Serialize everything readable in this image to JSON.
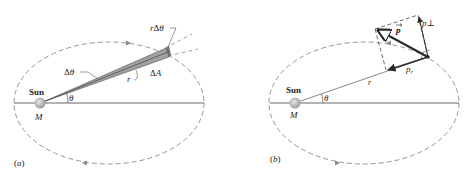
{
  "panels": [
    {
      "id": "a",
      "caption": "(a)",
      "sun_label": "Sun",
      "mass_label": "M",
      "angle_label": "θ",
      "delta_angle_label": "Δθ",
      "arc_label": "rΔθ",
      "radius_label": "r",
      "area_label": "ΔA"
    },
    {
      "id": "b",
      "caption": "(b)",
      "sun_label": "Sun",
      "mass_label": "M",
      "angle_label": "θ",
      "radius_label": "r",
      "momentum_label": "p",
      "momentum_perp_label": "p⊥",
      "momentum_radial_label": "p",
      "radial_subscript": "r"
    }
  ],
  "colors": {
    "orbit": "#8a8a8a",
    "axis": "#555555",
    "sun": "#b8b8b8",
    "wedge": "#9a9a9a",
    "vector": "#2a2a2a"
  }
}
